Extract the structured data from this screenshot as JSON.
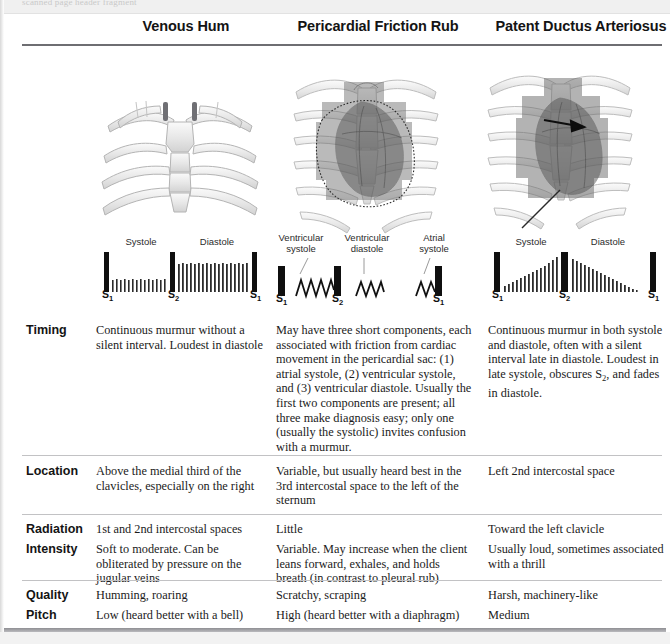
{
  "page": {
    "top_partial_text": "scanned page header fragment",
    "columns": [
      {
        "id": "venous-hum",
        "title": "Venous Hum"
      },
      {
        "id": "pericardial-friction-rub",
        "title": "Pericardial Friction Rub"
      },
      {
        "id": "patent-ductus-arteriosus",
        "title": "Patent Ductus Arteriosus"
      }
    ]
  },
  "waveforms": {
    "venous_hum": {
      "phase_labels": [
        "Systole",
        "Diastole"
      ],
      "sound_labels": [
        "S1",
        "S2",
        "S1"
      ]
    },
    "pericardial_friction_rub": {
      "phase_labels": [
        "Ventricular systole",
        "Ventricular diastole",
        "Atrial systole"
      ],
      "sound_labels": [
        "S1",
        "S2",
        "S1"
      ]
    },
    "patent_ductus_arteriosus": {
      "phase_labels": [
        "Systole",
        "Diastole"
      ],
      "sound_labels": [
        "S1",
        "S2",
        "S1"
      ]
    }
  },
  "rows": [
    {
      "label": "Timing",
      "venous_hum": "Continuous murmur without a silent interval. Loudest in diastole",
      "pericardial_friction_rub": "May have three short components, each associated with friction from cardiac movement in the pericardial sac: (1) atrial systole, (2) ventricular systole, and (3) ventricular diastole. Usually the first two components are present; all three make diagnosis easy; only one (usually the systolic) invites confusion with a murmur.",
      "patent_ductus_arteriosus_pre": "Continuous murmur in both systole and diastole, often with a silent interval late in diastole. Loudest in late systole, obscures ",
      "patent_ductus_arteriosus_sub": "2",
      "patent_ductus_arteriosus_post": ", and fades in diastole."
    },
    {
      "label": "Location",
      "venous_hum": "Above the medial third of the clavicles, especially on the right",
      "pericardial_friction_rub": "Variable, but usually heard best in the 3rd intercostal space to the left of the sternum",
      "patent_ductus_arteriosus": "Left 2nd intercostal space"
    },
    {
      "label": "Radiation",
      "venous_hum": "1st and 2nd intercostal spaces",
      "pericardial_friction_rub": "Little",
      "patent_ductus_arteriosus": "Toward the left clavicle"
    },
    {
      "label": "Intensity",
      "venous_hum": "Soft to moderate. Can be obliterated by pressure on the jugular veins",
      "pericardial_friction_rub": "Variable. May increase when the client leans forward, exhales, and holds breath (in contrast to pleural rub)",
      "patent_ductus_arteriosus": "Usually loud, sometimes associated with a thrill"
    },
    {
      "label": "Quality",
      "venous_hum": "Humming, roaring",
      "pericardial_friction_rub": "Scratchy, scraping",
      "patent_ductus_arteriosus": "Harsh, machinery-like"
    },
    {
      "label": "Pitch",
      "venous_hum": "Low (heard better with a bell)",
      "pericardial_friction_rub": "High (heard better with a diaphragm)",
      "patent_ductus_arteriosus": "Medium"
    }
  ],
  "colors": {
    "rule_dark": "#6e6e72",
    "rule_light": "#c2c2c4",
    "text": "#1b1b1b",
    "bone": "#e9e9e9",
    "heart_shade": "#8c8c8c"
  }
}
